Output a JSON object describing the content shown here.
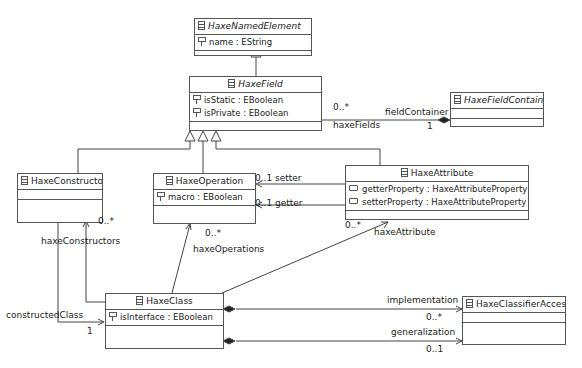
{
  "classes": {
    "named_element": {
      "name": "HaxeNamedElement",
      "abstract": true,
      "attrs": [
        "name : EString"
      ]
    },
    "field": {
      "name": "HaxeField",
      "abstract": true,
      "attrs": [
        "isStatic : EBoolean",
        "isPrivate : EBoolean"
      ]
    },
    "field_container": {
      "name": "HaxeFieldContainer",
      "abstract": true,
      "attrs": []
    },
    "constructor": {
      "name": "HaxeConstructor",
      "abstract": false,
      "attrs": []
    },
    "operation": {
      "name": "HaxeOperation",
      "abstract": false,
      "attrs": [
        "macro : EBoolean"
      ]
    },
    "attribute": {
      "name": "HaxeAttribute",
      "abstract": false,
      "attrs": [
        "getterProperty : HaxeAttributeProperty",
        "setterProperty : HaxeAttributeProperty"
      ]
    },
    "class": {
      "name": "HaxeClass",
      "abstract": false,
      "attrs": [
        "isInterface : EBoolean"
      ]
    },
    "classifier_access": {
      "name": "HaxeClassifierAccess",
      "abstract": false,
      "attrs": []
    }
  },
  "associations": {
    "field_container": {
      "role_near": "fieldContainer",
      "mult_near": "1",
      "role_far": "haxeFields",
      "mult_far": "0..*"
    },
    "setter": {
      "role": "setter",
      "mult": "0..1"
    },
    "getter": {
      "role": "getter",
      "mult": "0..1"
    },
    "constructors": {
      "role": "haxeConstructors",
      "mult": "0..*"
    },
    "constructed_class": {
      "role": "constructedClass",
      "mult": "1"
    },
    "operations": {
      "role": "haxeOperations",
      "mult": "0..*"
    },
    "attribute": {
      "role": "haxeAttribute",
      "mult": "0..*"
    },
    "implementation": {
      "role": "implementation",
      "mult": "0..*"
    },
    "generalization": {
      "role": "generalization",
      "mult": "0..1"
    }
  }
}
